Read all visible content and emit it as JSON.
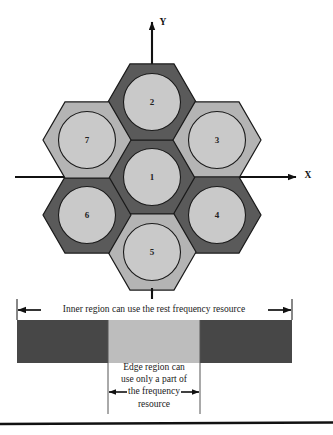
{
  "figure": {
    "axes": {
      "x_label": "X",
      "y_label": "Y"
    },
    "colors": {
      "dark_cell": "#5a5a5a",
      "light_cell": "#b4b4b4",
      "dark_circle": "#c9c9c9",
      "light_circle": "#c9c9c9",
      "outline": "#1a1a1a",
      "bar_dark": "#474747",
      "bar_light": "#bdbdbd",
      "background": "#ffffff"
    },
    "cells": [
      {
        "id": "1",
        "label": "1",
        "shade": "dark",
        "cx": 152,
        "cy": 177
      },
      {
        "id": "2",
        "label": "2",
        "shade": "dark",
        "cx": 152,
        "cy": 102
      },
      {
        "id": "3",
        "label": "3",
        "shade": "light",
        "cx": 217,
        "cy": 140
      },
      {
        "id": "4",
        "label": "4",
        "shade": "dark",
        "cx": 217,
        "cy": 215
      },
      {
        "id": "5",
        "label": "5",
        "shade": "light",
        "cx": 152,
        "cy": 252
      },
      {
        "id": "6",
        "label": "6",
        "shade": "dark",
        "cx": 87,
        "cy": 215
      },
      {
        "id": "7",
        "label": "7",
        "shade": "light",
        "cx": 87,
        "cy": 140
      }
    ],
    "annotations": {
      "inner_region": "Inner region can use the rest frequency resource",
      "edge_region_lines": [
        "Edge region can",
        "use only a part of",
        "the frequency",
        "resource"
      ]
    },
    "frequency_bar": {
      "left_segment_label": "",
      "middle_segment_label": "",
      "right_segment_label": "",
      "x_start": 17,
      "x_mid_start": 108,
      "x_mid_end": 200,
      "x_end": 292
    }
  }
}
